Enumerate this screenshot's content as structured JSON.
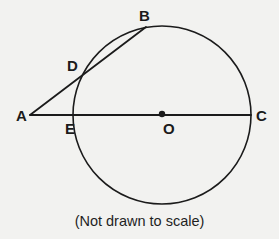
{
  "figure": {
    "caption": "(Not drawn to scale)",
    "background_color": "#f2f2f0",
    "stroke_color": "#1b1b1b",
    "labels": {
      "A": "A",
      "B": "B",
      "C": "C",
      "D": "D",
      "E": "E",
      "O": "O"
    }
  },
  "chart_data": {
    "type": "diagram",
    "title": "",
    "subtitle": "(Not drawn to scale)",
    "canvas": {
      "width": 279,
      "height": 239
    },
    "circle": {
      "cx": 162,
      "cy": 115,
      "r": 89,
      "stroke": "#1b1b1b",
      "stroke_width": 1.6,
      "fill": "none"
    },
    "points": [
      {
        "name": "A",
        "x": 30,
        "y": 115,
        "role": "external-vertex",
        "label_x": 16,
        "label_y": 108
      },
      {
        "name": "B",
        "x": 146,
        "y": 27,
        "role": "secant-far-intersection",
        "label_x": 139,
        "label_y": 8
      },
      {
        "name": "C",
        "x": 251,
        "y": 115,
        "role": "diameter-right-endpoint",
        "label_x": 256,
        "label_y": 108
      },
      {
        "name": "D",
        "x": 84,
        "y": 72,
        "role": "secant-near-intersection",
        "label_x": 67,
        "label_y": 58
      },
      {
        "name": "E",
        "x": 73,
        "y": 115,
        "role": "line-circle-left-intersection",
        "label_x": 65,
        "label_y": 121
      },
      {
        "name": "O",
        "x": 162,
        "y": 115,
        "role": "center",
        "label_x": 163,
        "label_y": 121
      }
    ],
    "segments": [
      {
        "name": "AC",
        "from": "A",
        "to": "C",
        "x1": 30,
        "y1": 115,
        "x2": 251,
        "y2": 115,
        "stroke": "#1b1b1b",
        "stroke_width": 1.8
      },
      {
        "name": "AB",
        "from": "A",
        "to": "B",
        "x1": 30,
        "y1": 115,
        "x2": 146,
        "y2": 27,
        "stroke": "#1b1b1b",
        "stroke_width": 1.8
      }
    ],
    "markers": [
      {
        "name": "center-dot",
        "x": 162,
        "y": 114,
        "r": 3.2,
        "fill": "#1b1b1b"
      }
    ]
  }
}
